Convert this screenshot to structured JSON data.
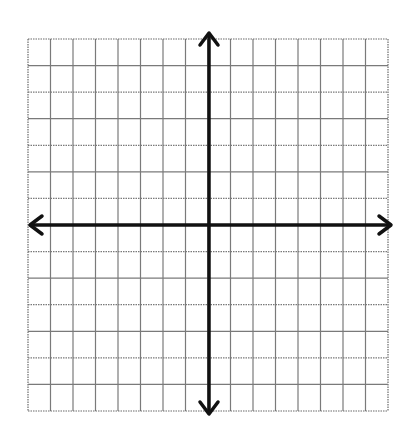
{
  "diagram": {
    "type": "coordinate-grid",
    "grid": {
      "columns": 16,
      "rows": 14,
      "left": 28,
      "top": 39,
      "right": 388,
      "bottom": 411,
      "line_color": "#7a7a7a",
      "border_color": "#6a6a6a"
    },
    "axes": {
      "x_axis_y": 225,
      "y_axis_x": 209,
      "x_left_tip": 30,
      "x_right_tip": 391,
      "y_top_tip": 33,
      "y_bottom_tip": 414,
      "color": "#111111",
      "width": 3.5,
      "arrows": [
        "left",
        "right",
        "up",
        "down"
      ]
    },
    "background": "#ffffff"
  }
}
